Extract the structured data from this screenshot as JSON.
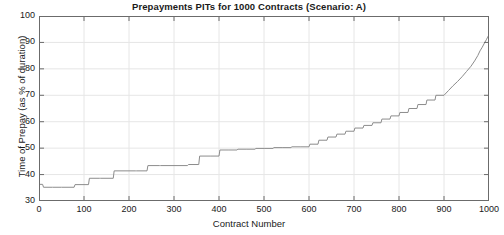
{
  "chart_data": {
    "type": "line",
    "title": "Prepayments PITs for 1000 Contracts (Scenario: A)",
    "xlabel": "Contract Number",
    "ylabel": "Time of Prepay (as % of duration)",
    "xlim": [
      0,
      1000
    ],
    "ylim": [
      30,
      100
    ],
    "xticks": [
      0,
      100,
      200,
      300,
      400,
      500,
      600,
      700,
      800,
      900,
      1000
    ],
    "yticks": [
      30,
      40,
      50,
      60,
      70,
      80,
      90,
      100
    ],
    "grid": true,
    "legend": null,
    "series": [
      {
        "name": "Prepayment PIT",
        "line_color": "#8c8c8c",
        "line_width": 1,
        "x": [
          0,
          8,
          10,
          30,
          50,
          78,
          80,
          110,
          112,
          135,
          137,
          165,
          167,
          215,
          217,
          240,
          242,
          268,
          270,
          330,
          332,
          355,
          357,
          380,
          382,
          400,
          402,
          420,
          422,
          440,
          442,
          460,
          462,
          480,
          482,
          500,
          502,
          520,
          522,
          540,
          542,
          560,
          562,
          580,
          582,
          600,
          602,
          620,
          622,
          640,
          642,
          660,
          662,
          680,
          682,
          700,
          702,
          720,
          722,
          740,
          742,
          760,
          762,
          780,
          782,
          800,
          802,
          820,
          822,
          840,
          842,
          860,
          862,
          880,
          882,
          900,
          910,
          920,
          930,
          940,
          950,
          960,
          968,
          975,
          980,
          985,
          990,
          994,
          997,
          1000
        ],
        "y": [
          36.3,
          36.3,
          35.2,
          35.2,
          35.2,
          35.2,
          36.2,
          36.2,
          38.6,
          38.6,
          38.6,
          38.6,
          41.4,
          41.4,
          41.4,
          41.4,
          43.4,
          43.4,
          43.4,
          43.4,
          43.8,
          43.8,
          47.0,
          47.0,
          47.0,
          47.0,
          49.3,
          49.3,
          49.3,
          49.3,
          49.6,
          49.6,
          49.6,
          49.6,
          49.9,
          49.9,
          49.9,
          49.9,
          50.2,
          50.2,
          50.2,
          50.2,
          50.5,
          50.5,
          50.5,
          50.5,
          51.5,
          51.5,
          53.0,
          53.0,
          54.2,
          54.2,
          55.3,
          55.3,
          56.4,
          56.4,
          57.6,
          57.6,
          58.6,
          58.6,
          59.6,
          59.6,
          61.0,
          61.0,
          62.2,
          62.2,
          63.5,
          63.5,
          65.0,
          65.0,
          66.5,
          66.5,
          68.2,
          68.2,
          70.0,
          70.0,
          71.8,
          73.6,
          75.2,
          77.0,
          79.0,
          81.0,
          83.0,
          85.0,
          86.8,
          88.2,
          89.8,
          91.0,
          92.0,
          92.8
        ],
        "description": "Monotonically increasing step/staircase curve; flat plateaus near 35-36 below contract 100, stepping up through the 40s, a long plateau near 50 from contract ~500 to ~690, then a progressively steepening rise to about 93 at contract 1000."
      }
    ]
  },
  "style": {
    "axis_color": "#6b6b6b",
    "grid_color": "#e6e6e6",
    "text_color": "#1a1a1a",
    "background": "#ffffff"
  }
}
